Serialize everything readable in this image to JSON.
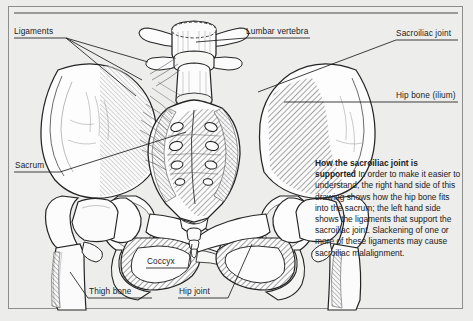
{
  "figure": {
    "kind": "anatomical-illustration"
  },
  "labels": [
    {
      "id": "ligaments",
      "text": "Ligaments"
    },
    {
      "id": "lumbar-vertebra",
      "text": "Lumbar vertebra"
    },
    {
      "id": "sacroiliac-joint",
      "text": "Sacroiliac joint"
    },
    {
      "id": "hip-bone-ilium",
      "text": "Hip bone (ilium)"
    },
    {
      "id": "sacrum",
      "text": "Sacrum"
    },
    {
      "id": "coccyx",
      "text": "Coccyx"
    },
    {
      "id": "thigh-bone",
      "text": "Thigh bone"
    },
    {
      "id": "hip-joint",
      "text": "Hip joint"
    }
  ],
  "caption": {
    "heading": "How the sacroiliac joint is supported",
    "body": " In order to make it easier to understand, the right hand side of this drawing shows how the hip bone fits into the sacrum; the left hand side shows the ligaments that support the sacroiliac joint. Slackening of one or more of these ligaments may cause sacroiliac malalignment."
  },
  "colors": {
    "page_background": "#ececeb",
    "panel_background": "#ededec",
    "frame_border": "#8d8d8d",
    "ink": "#1c1c1c",
    "bone_fill": "#fdfdfd",
    "shadow_fill": "#d8d8d6"
  }
}
